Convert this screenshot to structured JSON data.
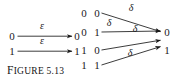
{
  "figure": {
    "caption_lead": "F",
    "caption_rest": "IGURE",
    "caption_number": "5.13",
    "caption_full": "FIGURE 5.13"
  },
  "colors": {
    "ink": "#1a1a1a",
    "background": "#ffffff"
  },
  "left_diagram": {
    "name": "epsilon-transition-diagram",
    "label_symbol": "ε",
    "sources": [
      {
        "label": "0"
      },
      {
        "label": "1"
      }
    ],
    "targets": [
      {
        "label": "0"
      },
      {
        "label": "1"
      }
    ],
    "edges": [
      {
        "from": "0",
        "to": "0",
        "label": "ε"
      },
      {
        "from": "1",
        "to": "1",
        "label": "ε"
      }
    ]
  },
  "right_diagram": {
    "name": "delta-transition-diagram",
    "label_symbol": "δ",
    "sources": [
      {
        "first": "0",
        "second": "0"
      },
      {
        "first": "0",
        "second": "1"
      },
      {
        "first": "1",
        "second": "0"
      },
      {
        "first": "1",
        "second": "1"
      }
    ],
    "targets": [
      {
        "label": "0"
      },
      {
        "label": "1"
      }
    ],
    "edges": [
      {
        "from": "0 0",
        "to": "0",
        "label": "δ"
      },
      {
        "from": "0 1",
        "to": "0",
        "label": "δ"
      },
      {
        "from": "1 0",
        "to": "1",
        "label": "δ"
      },
      {
        "from": "1 1",
        "to": "1",
        "label": "δ"
      }
    ]
  }
}
